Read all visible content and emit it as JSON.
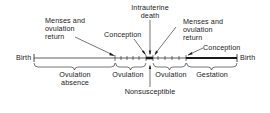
{
  "diagram": {
    "labels": {
      "birth_left": "Birth",
      "birth_right": "Birth",
      "menses_return_1_line1": "Menses and",
      "menses_return_1_line2": "ovulation",
      "menses_return_1_line3": "return",
      "conception_1": "Conception",
      "intrauterine_death_line1": "Intrauterine",
      "intrauterine_death_line2": "death",
      "menses_return_2_line1": "Menses and",
      "menses_return_2_line2": "ovulation",
      "menses_return_2_line3": "return",
      "conception_2": "Conception",
      "nonsusceptible": "Nonsusceptible"
    },
    "phases": [
      {
        "label_line1": "Ovulation",
        "label_line2": "absence",
        "start_x": 34,
        "end_x": 115
      },
      {
        "label_line1": "Ovulation",
        "label_line2": "",
        "start_x": 115,
        "end_x": 146
      },
      {
        "label_line1": "Ovulation",
        "label_line2": "",
        "start_x": 154,
        "end_x": 186
      },
      {
        "label_line1": "Gestation",
        "label_line2": "",
        "start_x": 186,
        "end_x": 237
      }
    ],
    "colors": {
      "ink": "#1a1a1a",
      "background": "#ffffff"
    }
  }
}
